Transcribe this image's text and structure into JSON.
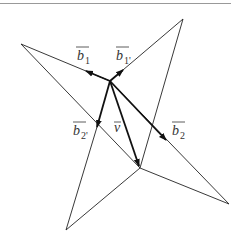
{
  "diagram": {
    "type": "vector-decomposition",
    "colors": {
      "line": "#222222",
      "text": "#333333",
      "rule": "#888888"
    },
    "points": {
      "top": [
        183,
        19
      ],
      "left": [
        21,
        44
      ],
      "bottom": [
        66,
        230
      ],
      "right": [
        229,
        204
      ],
      "center": [
        110,
        81
      ],
      "lower": [
        140,
        168
      ]
    },
    "labels": {
      "b1": {
        "base": "b",
        "sub": "1"
      },
      "b1p": {
        "base": "b",
        "sub": "1'"
      },
      "b2": {
        "base": "b",
        "sub": "2"
      },
      "b2p": {
        "base": "b",
        "sub": "2'"
      },
      "v": {
        "base": "v"
      }
    }
  }
}
